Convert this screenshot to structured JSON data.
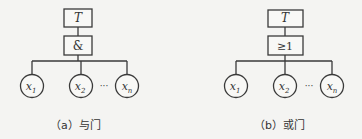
{
  "diagrams": [
    {
      "id": "and-gate",
      "top_event": "T",
      "gate_symbol": "&",
      "inputs": [
        "x1",
        "x2",
        "xn"
      ],
      "ellipsis": "···",
      "caption": "（a）与门"
    },
    {
      "id": "or-gate",
      "top_event": "T",
      "gate_symbol": "≥1",
      "inputs": [
        "x1",
        "x2",
        "xn"
      ],
      "ellipsis": "···",
      "caption": "（b）或门"
    }
  ],
  "colors": {
    "line": "#3a3a3a",
    "background": "#f4f4f2",
    "box_fill": "#f8f8f6"
  }
}
